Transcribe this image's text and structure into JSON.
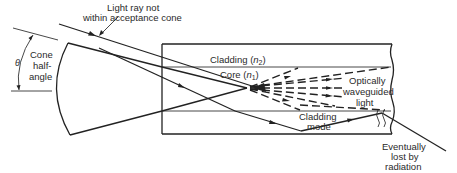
{
  "figure": {
    "colors": {
      "line": "#222222",
      "text": "#2a2a2a",
      "background": "#ffffff"
    }
  },
  "labels": {
    "light_ray": {
      "line1": "Light ray not",
      "line2": "within acceptance cone"
    },
    "cone": {
      "line1": "Cone",
      "line2": "half-",
      "line3": "angle",
      "symbol": "θ"
    },
    "cladding_top": {
      "text": "Cladding (",
      "var": "n",
      "sub": "2",
      "close": ")"
    },
    "core": {
      "text": "Core (",
      "var": "n",
      "sub": "1",
      "close": ")"
    },
    "waveguided": {
      "line1": "Optically",
      "line2": "waveguided",
      "line3": "light"
    },
    "cladding_mode": {
      "line1": "Cladding",
      "line2": "mode"
    },
    "radiation": {
      "line1": "Eventually",
      "line2": "lost by",
      "line3": "radiation"
    }
  }
}
